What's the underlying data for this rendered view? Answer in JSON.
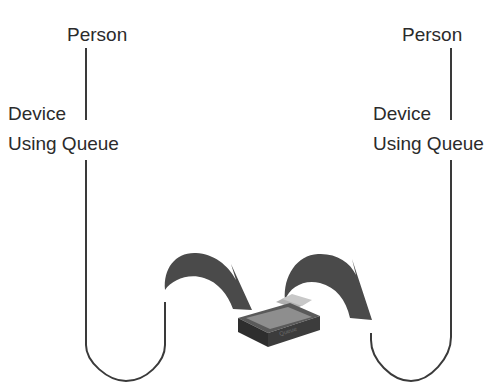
{
  "diagram": {
    "left_station": {
      "person_label": "Person",
      "device_label": "Device",
      "queue_label": "Using Queue"
    },
    "right_station": {
      "person_label": "Person",
      "device_label": "Device",
      "queue_label": "Using Queue"
    },
    "center": {
      "queue_box_icon": "card-file-box-icon",
      "arrows": [
        "curved-arrow-into-queue",
        "curved-arrow-out-of-queue"
      ]
    },
    "colors": {
      "line": "#3a3a3a",
      "arrow_fill": "#4a4a4a",
      "box_dark": "#3c3c3c",
      "box_light": "#9a9a9a"
    }
  }
}
